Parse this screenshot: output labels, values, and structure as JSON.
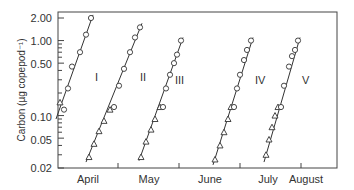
{
  "chart_data": {
    "type": "scatter",
    "title": "",
    "xlabel": "",
    "ylabel": "Carbon (µg copepod⁻¹)",
    "yscale": "log",
    "ylim": [
      0.02,
      2.0
    ],
    "y_ticks": [
      {
        "value": 2.0,
        "label": "2.00"
      },
      {
        "value": 1.0,
        "label": "1.00"
      },
      {
        "value": 0.5,
        "label": "0.50"
      },
      {
        "value": 0.1,
        "label": "0.10"
      },
      {
        "value": 0.05,
        "label": "0.05"
      },
      {
        "value": 0.02,
        "label": "0.02"
      }
    ],
    "x_months": [
      "April",
      "May",
      "June",
      "July",
      "August"
    ],
    "grid": false,
    "legend": null,
    "markers": {
      "circle": "open circle",
      "triangle": "open triangle"
    },
    "series": [
      {
        "name": "I",
        "triangle_points": [
          {
            "x": 60,
            "y": 0.15
          }
        ],
        "circle_points": [
          {
            "x": 64,
            "y": 0.12
          },
          {
            "x": 68,
            "y": 0.23
          },
          {
            "x": 72,
            "y": 0.45
          },
          {
            "x": 80,
            "y": 0.7
          },
          {
            "x": 86,
            "y": 1.2
          },
          {
            "x": 91,
            "y": 2.0
          }
        ],
        "fit_line": {
          "x1": 56,
          "y1": 0.09,
          "x2": 93,
          "y2": 2.2
        }
      },
      {
        "name": "II",
        "triangle_points": [
          {
            "x": 89,
            "y": 0.028
          },
          {
            "x": 94,
            "y": 0.042
          },
          {
            "x": 99,
            "y": 0.062
          },
          {
            "x": 104,
            "y": 0.085
          },
          {
            "x": 110,
            "y": 0.12
          }
        ],
        "circle_points": [
          {
            "x": 114,
            "y": 0.13
          },
          {
            "x": 119,
            "y": 0.25
          },
          {
            "x": 124,
            "y": 0.42
          },
          {
            "x": 130,
            "y": 0.7
          },
          {
            "x": 135,
            "y": 1.1
          },
          {
            "x": 140,
            "y": 1.5
          }
        ],
        "fit_line": {
          "x1": 86,
          "y1": 0.024,
          "x2": 142,
          "y2": 1.7
        }
      },
      {
        "name": "III",
        "triangle_points": [
          {
            "x": 141,
            "y": 0.028
          },
          {
            "x": 146,
            "y": 0.045
          },
          {
            "x": 151,
            "y": 0.065
          },
          {
            "x": 155,
            "y": 0.09
          },
          {
            "x": 160,
            "y": 0.13
          }
        ],
        "circle_points": [
          {
            "x": 163,
            "y": 0.13
          },
          {
            "x": 166,
            "y": 0.23
          },
          {
            "x": 170,
            "y": 0.35
          },
          {
            "x": 174,
            "y": 0.5
          },
          {
            "x": 177,
            "y": 0.65
          },
          {
            "x": 181,
            "y": 1.0
          }
        ],
        "fit_line": {
          "x1": 139,
          "y1": 0.025,
          "x2": 183,
          "y2": 1.1
        }
      },
      {
        "name": "IV",
        "triangle_points": [
          {
            "x": 215,
            "y": 0.026
          },
          {
            "x": 220,
            "y": 0.04
          },
          {
            "x": 224,
            "y": 0.06
          },
          {
            "x": 228,
            "y": 0.09
          },
          {
            "x": 231,
            "y": 0.13
          }
        ],
        "circle_points": [
          {
            "x": 234,
            "y": 0.13
          },
          {
            "x": 237,
            "y": 0.23
          },
          {
            "x": 240,
            "y": 0.35
          },
          {
            "x": 244,
            "y": 0.55
          },
          {
            "x": 247,
            "y": 0.75
          },
          {
            "x": 251,
            "y": 1.0
          }
        ],
        "fit_line": {
          "x1": 213,
          "y1": 0.022,
          "x2": 253,
          "y2": 1.1
        }
      },
      {
        "name": "V",
        "triangle_points": [
          {
            "x": 266,
            "y": 0.03
          },
          {
            "x": 269,
            "y": 0.048
          },
          {
            "x": 272,
            "y": 0.07
          },
          {
            "x": 275,
            "y": 0.1
          },
          {
            "x": 278,
            "y": 0.13
          }
        ],
        "circle_points": [
          {
            "x": 281,
            "y": 0.13
          },
          {
            "x": 284,
            "y": 0.25
          },
          {
            "x": 289,
            "y": 0.45
          },
          {
            "x": 292,
            "y": 0.62
          },
          {
            "x": 295,
            "y": 0.75
          },
          {
            "x": 298,
            "y": 1.0
          }
        ],
        "fit_line": {
          "x1": 264,
          "y1": 0.024,
          "x2": 300,
          "y2": 1.1
        }
      }
    ]
  },
  "axis": {
    "ylabel": "Carbon (µg copepod⁻¹)",
    "y_tick_labels": [
      "2.00",
      "1.00",
      "0.50",
      "0.10",
      "0.05",
      "0.02"
    ],
    "month_labels": [
      "April",
      "May",
      "June",
      "July",
      "August"
    ]
  },
  "cohort_labels": [
    "I",
    "II",
    "III",
    "IV",
    "V"
  ]
}
